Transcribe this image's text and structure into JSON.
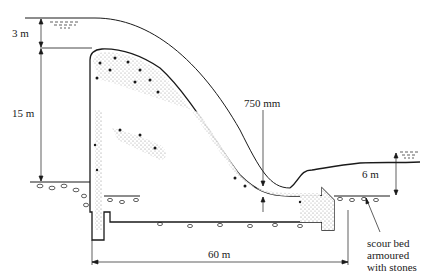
{
  "diagram": {
    "labels": {
      "upstream_head": "3 m",
      "dam_height": "15 m",
      "jet_thickness": "750 mm",
      "tailwater_depth": "6 m",
      "apron_length": "60 m",
      "scour_note_line1": "scour bed",
      "scour_note_line2": "armoured",
      "scour_note_line3": "with stones"
    },
    "colors": {
      "ink": "#1a1a1a",
      "stipple": "#9a9a9a",
      "background": "#ffffff"
    }
  }
}
